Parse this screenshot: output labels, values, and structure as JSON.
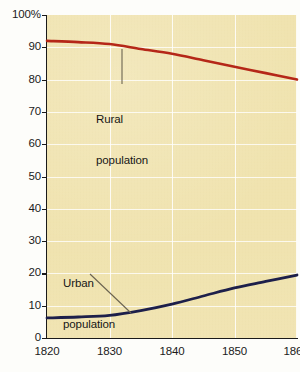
{
  "chart_data": {
    "type": "line",
    "title": "",
    "subtitle": "",
    "xlabel": "",
    "ylabel": "",
    "xlim": [
      1820,
      1860
    ],
    "ylim": [
      0,
      100
    ],
    "grid": true,
    "legend_position": "inline-annotations",
    "x_ticks": [
      "1820",
      "1830",
      "1840",
      "1850",
      "1860"
    ],
    "y_ticks": [
      "0",
      "10",
      "20",
      "30",
      "40",
      "50",
      "60",
      "70",
      "80",
      "90",
      "100%"
    ],
    "y_axis_unit": "%",
    "x": [
      1820,
      1825,
      1830,
      1835,
      1840,
      1845,
      1850,
      1855,
      1860
    ],
    "series": [
      {
        "name": "Rural population",
        "color": "#b52718",
        "values": [
          92.0,
          91.6,
          91.0,
          89.5,
          88.0,
          86.0,
          84.0,
          82.0,
          80.0
        ]
      },
      {
        "name": "Urban population",
        "color": "#1d1f4a",
        "values": [
          6.2,
          6.5,
          7.0,
          8.5,
          10.5,
          13.0,
          15.5,
          17.5,
          19.5
        ]
      }
    ],
    "annotations": [
      {
        "id": "rural",
        "text_line1": "Rural",
        "text_line2": "population"
      },
      {
        "id": "urban",
        "text_line1": "Urban",
        "text_line2": "population"
      }
    ],
    "plot_background_color": "#f0e3ae",
    "gridline_color": "#ffffff",
    "axis_color": "#1a1a1a"
  }
}
